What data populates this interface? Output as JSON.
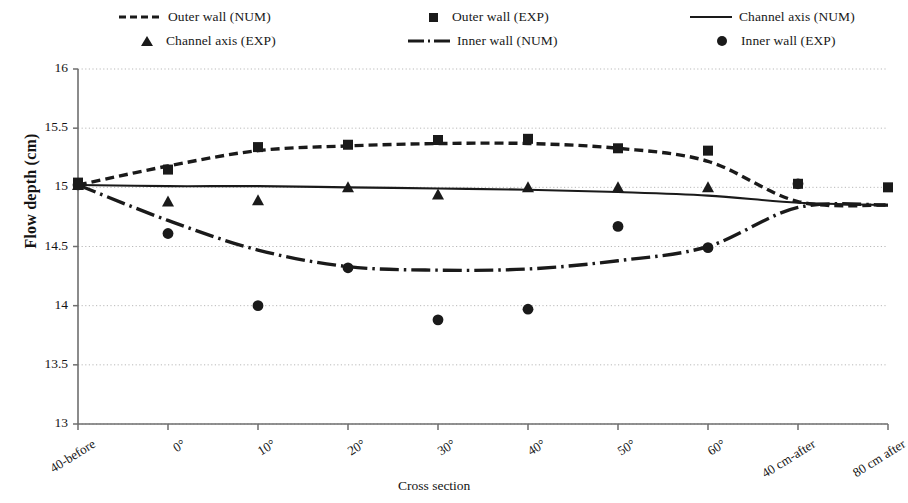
{
  "chart_data": {
    "type": "line",
    "title": "",
    "xlabel": "Cross section",
    "ylabel": "Flow depth (cm)",
    "categories": [
      "40-before",
      "0°",
      "10°",
      "20°",
      "30°",
      "40°",
      "50°",
      "60°",
      "40 cm-after",
      "80 cm after"
    ],
    "ylim": [
      13,
      16
    ],
    "ytick_labels": [
      "13",
      "13.5",
      "14",
      "14.5",
      "15",
      "15.5",
      "16"
    ],
    "ytick_values": [
      13,
      13.5,
      14,
      14.5,
      15,
      15.5,
      16
    ],
    "grid": "horizontal-dotted",
    "legend_position": "top",
    "series": [
      {
        "name": "Outer wall (NUM)",
        "style": "dashed-line",
        "color": "#1a1a1a",
        "values": [
          15.02,
          15.18,
          15.31,
          15.35,
          15.37,
          15.37,
          15.33,
          15.22,
          14.88,
          14.85
        ]
      },
      {
        "name": "Outer wall (EXP)",
        "style": "square-marker",
        "color": "#1a1a1a",
        "values": [
          15.04,
          15.15,
          15.34,
          15.36,
          15.4,
          15.41,
          15.33,
          15.31,
          15.03,
          15.0
        ]
      },
      {
        "name": "Channel axis (NUM)",
        "style": "solid-line",
        "color": "#1a1a1a",
        "values": [
          15.02,
          15.01,
          15.01,
          15.0,
          14.99,
          14.98,
          14.96,
          14.93,
          14.87,
          14.85
        ]
      },
      {
        "name": "Channel axis (EXP)",
        "style": "triangle-marker",
        "color": "#1a1a1a",
        "values": [
          15.02,
          14.88,
          14.89,
          15.0,
          14.94,
          15.0,
          15.0,
          15.0,
          null,
          null
        ]
      },
      {
        "name": "Inner wall (NUM)",
        "style": "dash-dot-line",
        "color": "#1a1a1a",
        "values": [
          15.02,
          14.72,
          14.47,
          14.33,
          14.3,
          14.31,
          14.38,
          14.5,
          14.83,
          14.85
        ]
      },
      {
        "name": "Inner wall (EXP)",
        "style": "circle-marker",
        "color": "#1a1a1a",
        "values": [
          15.02,
          14.61,
          14.0,
          14.32,
          13.88,
          13.97,
          14.67,
          14.49,
          15.03,
          null
        ]
      }
    ]
  },
  "legend": {
    "items": [
      {
        "label": "Outer wall (NUM)",
        "key": "dashed-line-key"
      },
      {
        "label": "Outer wall (EXP)",
        "key": "square-marker-key"
      },
      {
        "label": "Channel axis (NUM)",
        "key": "solid-line-key"
      },
      {
        "label": "Channel axis (EXP)",
        "key": "triangle-marker-key"
      },
      {
        "label": "Inner wall (NUM)",
        "key": "dash-dot-line-key"
      },
      {
        "label": "Inner wall (EXP)",
        "key": "circle-marker-key"
      }
    ]
  }
}
